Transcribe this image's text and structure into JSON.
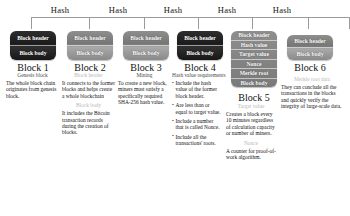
{
  "diagram": {
    "hash_labels": [
      "Hash",
      "Hash",
      "Hash",
      "Hash",
      "Hash"
    ],
    "blocks": [
      {
        "caption": "Block 1",
        "style": "dark",
        "rows": [
          "Block header",
          "Block body"
        ],
        "sections": [
          {
            "heading": "Genesis block",
            "heading_tone": "dark",
            "body": "The whole block chain originates from genesis block."
          }
        ]
      },
      {
        "caption": "Block 2",
        "style": "gray",
        "rows": [
          "Block header",
          "Block body"
        ],
        "sections": [
          {
            "heading": "Block header",
            "heading_tone": "light",
            "body": "It connects to the former blocks and helps create a whole blockchain"
          },
          {
            "heading": "Block body",
            "heading_tone": "light",
            "body": "It includes the Bitcoin transaction records during the creation of blocks."
          }
        ]
      },
      {
        "caption": "Block 3",
        "style": "gray",
        "rows": [
          "Block header",
          "Block body"
        ],
        "sections": [
          {
            "heading": "Mining",
            "heading_tone": "dark",
            "body": "To create a new block, miners must satisfy a specifically required SHA-256 hash value."
          }
        ]
      },
      {
        "caption": "Block 4",
        "style": "dark",
        "rows": [
          "Block header",
          "Block body"
        ],
        "sections": [
          {
            "heading": "Hash value requirements",
            "heading_tone": "dark",
            "body": ""
          }
        ],
        "bullets": [
          "Include the hash value of the former block header.",
          "Are less than or equal to target value.",
          "Include a number that is called Nonce.",
          "Include all the transactions' roots."
        ]
      },
      {
        "caption": "Block 5",
        "style": "tall",
        "rows": [
          "Block header",
          "Hash value",
          "Target value",
          "Nonce",
          "Merkle root",
          "Block body"
        ],
        "sections": [
          {
            "heading": "Target value",
            "heading_tone": "light",
            "body": "Creates a block every 10 minutes regardless of calculation capacity or number of miners."
          },
          {
            "heading": "Nonce",
            "heading_tone": "light",
            "body": "A counter for proof-of-work algorithm."
          }
        ]
      },
      {
        "caption": "Block 6",
        "style": "gray",
        "rows": [
          "Block header",
          "Block body"
        ],
        "sections": [
          {
            "heading": "Merkle root data",
            "heading_tone": "light",
            "body": "They can conclude all the transactions in the blocks and quickly verify the integrity of large-scale data."
          }
        ]
      }
    ]
  }
}
